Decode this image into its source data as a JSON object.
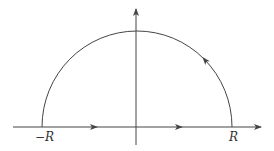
{
  "diagram": {
    "type": "semicircular contour in the complex plane",
    "colors": {
      "stroke": "#444444",
      "background": "#ffffff"
    },
    "labels": {
      "left_endpoint": "−R",
      "right_endpoint": "R"
    },
    "axes": {
      "horizontal": {
        "direction": "right",
        "arrow": true
      },
      "vertical": {
        "direction": "up",
        "arrow": true
      }
    },
    "contour": {
      "segments": [
        {
          "name": "real-segment",
          "from": "-R",
          "to": "R",
          "direction_arrows": 2
        },
        {
          "name": "semicircular-arc",
          "from": "R",
          "to": "-R",
          "orientation": "counterclockwise",
          "direction_arrows": 1
        }
      ]
    }
  }
}
